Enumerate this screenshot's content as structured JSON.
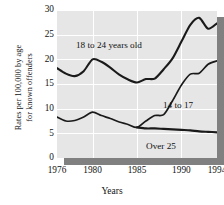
{
  "chart_data": {
    "type": "line",
    "title": "",
    "xlabel": "Years",
    "ylabel_line1": "Rates per 100,000 by age",
    "ylabel_line2": "for known offenders",
    "xlim": [
      1976,
      1994
    ],
    "ylim": [
      0,
      30
    ],
    "xticks": [
      1976,
      1980,
      1985,
      1990,
      1994
    ],
    "yticks": [
      0,
      5,
      10,
      15,
      20,
      25,
      30
    ],
    "grid": true,
    "legend_position": "inline-annotations",
    "panel_color": "#e6e6e6",
    "grid_color": "#ffffff",
    "line_color": "#1a1a1a",
    "shadow_color": "#808080",
    "x": [
      1976,
      1977,
      1978,
      1979,
      1980,
      1981,
      1982,
      1983,
      1984,
      1985,
      1986,
      1987,
      1988,
      1989,
      1990,
      1991,
      1992,
      1993,
      1994
    ],
    "series": [
      {
        "name": "18 to 24 years old",
        "label": "18 to 24 years old",
        "values": [
          18.2,
          17.1,
          16.6,
          17.6,
          20.0,
          19.5,
          18.3,
          16.9,
          15.9,
          15.3,
          16.0,
          16.1,
          18.0,
          20.2,
          23.6,
          27.0,
          28.4,
          26.2,
          27.3
        ]
      },
      {
        "name": "14 to 17",
        "label": "14 to 17",
        "values": [
          8.3,
          7.5,
          7.6,
          8.3,
          9.3,
          8.6,
          8.0,
          7.3,
          6.8,
          6.2,
          7.5,
          8.6,
          8.8,
          11.6,
          14.8,
          17.0,
          17.2,
          19.0,
          19.7
        ]
      },
      {
        "name": "Over 25",
        "label": "Over 25",
        "values": [
          null,
          null,
          null,
          null,
          null,
          null,
          null,
          null,
          null,
          6.2,
          6.0,
          6.0,
          5.9,
          5.8,
          5.7,
          5.6,
          5.4,
          5.3,
          5.2
        ]
      }
    ]
  }
}
